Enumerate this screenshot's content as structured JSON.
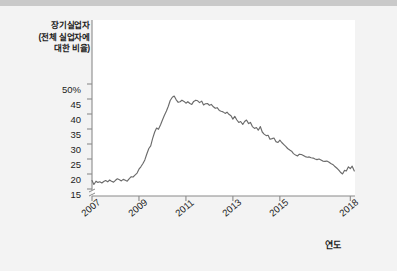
{
  "figure": {
    "background_color": "#f3f3f3",
    "plot_background_color": "#ffffff",
    "top_bar_color": "#c9c9c9",
    "line_color": "#6b6b6b",
    "axis_color": "#8a8a8a"
  },
  "chart_data": {
    "type": "line",
    "title": "",
    "subtitle": "",
    "ylabel": "장기실업자\n(전체 실업자에\n대한 비율)",
    "ylabel_lines": [
      "장기실업자",
      "(전체 실업자에",
      "대한 비율)"
    ],
    "xlabel": "연도",
    "ylim": [
      13,
      51
    ],
    "xlim": [
      2007.0,
      2018.2
    ],
    "grid": false,
    "legend": null,
    "axis_break_y": true,
    "ytick_labels": [
      "50%",
      "45",
      "40",
      "35",
      "30",
      "25",
      "20",
      "15"
    ],
    "ytick_values": [
      50,
      45,
      40,
      35,
      30,
      25,
      20,
      15
    ],
    "xtick_labels": [
      "2007",
      "2009",
      "2011",
      "2013",
      "2015",
      "2018"
    ],
    "xtick_values": [
      2007,
      2009,
      2011,
      2013,
      2015,
      2018
    ],
    "series": [
      {
        "name": "장기실업자 비율",
        "units": "percent",
        "x": [
          2007.0,
          2007.08,
          2007.17,
          2007.25,
          2007.33,
          2007.42,
          2007.5,
          2007.58,
          2007.67,
          2007.75,
          2007.83,
          2007.92,
          2008.0,
          2008.08,
          2008.17,
          2008.25,
          2008.33,
          2008.42,
          2008.5,
          2008.58,
          2008.67,
          2008.75,
          2008.83,
          2008.92,
          2009.0,
          2009.08,
          2009.17,
          2009.25,
          2009.33,
          2009.42,
          2009.5,
          2009.58,
          2009.67,
          2009.75,
          2009.83,
          2009.92,
          2010.0,
          2010.08,
          2010.17,
          2010.25,
          2010.33,
          2010.42,
          2010.5,
          2010.58,
          2010.67,
          2010.75,
          2010.83,
          2010.92,
          2011.0,
          2011.08,
          2011.17,
          2011.25,
          2011.33,
          2011.42,
          2011.5,
          2011.58,
          2011.67,
          2011.75,
          2011.83,
          2011.92,
          2012.0,
          2012.08,
          2012.17,
          2012.25,
          2012.33,
          2012.42,
          2012.5,
          2012.58,
          2012.67,
          2012.75,
          2012.83,
          2012.92,
          2013.0,
          2013.08,
          2013.17,
          2013.25,
          2013.33,
          2013.42,
          2013.5,
          2013.58,
          2013.67,
          2013.75,
          2013.83,
          2013.92,
          2014.0,
          2014.08,
          2014.17,
          2014.25,
          2014.33,
          2014.42,
          2014.5,
          2014.58,
          2014.67,
          2014.75,
          2014.83,
          2014.92,
          2015.0,
          2015.08,
          2015.17,
          2015.25,
          2015.33,
          2015.42,
          2015.5,
          2015.58,
          2015.67,
          2015.75,
          2015.83,
          2015.92,
          2016.0,
          2016.08,
          2016.17,
          2016.25,
          2016.33,
          2016.42,
          2016.5,
          2016.58,
          2016.67,
          2016.75,
          2016.83,
          2016.92,
          2017.0,
          2017.08,
          2017.17,
          2017.25,
          2017.33,
          2017.42,
          2017.5,
          2017.58,
          2017.67,
          2017.75,
          2017.83,
          2017.92,
          2018.0,
          2018.08,
          2018.17
        ],
        "values": [
          17.8,
          16.5,
          17.6,
          17.2,
          17.4,
          17.0,
          17.5,
          17.8,
          17.4,
          18.0,
          17.6,
          17.3,
          17.9,
          18.4,
          18.1,
          17.7,
          18.2,
          17.9,
          17.6,
          18.4,
          19.1,
          19.0,
          19.6,
          20.3,
          21.6,
          22.4,
          23.5,
          24.7,
          26.6,
          28.5,
          29.4,
          31.8,
          34.0,
          35.3,
          34.9,
          36.4,
          38.0,
          39.5,
          41.0,
          42.6,
          44.5,
          45.6,
          46.0,
          44.8,
          43.9,
          44.1,
          44.6,
          44.2,
          43.6,
          44.1,
          43.5,
          43.2,
          44.2,
          44.6,
          44.4,
          43.8,
          44.3,
          43.0,
          43.4,
          43.5,
          42.9,
          43.2,
          42.4,
          41.9,
          42.1,
          41.2,
          40.9,
          40.7,
          40.2,
          40.6,
          39.9,
          39.4,
          38.3,
          39.2,
          38.0,
          37.2,
          37.5,
          36.5,
          37.5,
          38.0,
          36.8,
          37.2,
          35.8,
          35.2,
          35.5,
          34.6,
          35.8,
          34.0,
          33.3,
          32.8,
          32.9,
          31.6,
          31.8,
          32.0,
          30.8,
          30.5,
          31.3,
          30.5,
          29.8,
          29.2,
          28.5,
          28.0,
          27.6,
          26.8,
          26.3,
          26.0,
          26.6,
          26.5,
          26.2,
          25.8,
          25.6,
          25.7,
          25.4,
          25.3,
          25.0,
          24.8,
          25.0,
          24.7,
          24.3,
          24.2,
          24.3,
          24.0,
          23.5,
          23.2,
          22.6,
          22.0,
          21.4,
          20.6,
          20.0,
          21.2,
          21.0,
          22.4,
          21.8,
          22.6,
          21.0
        ]
      }
    ]
  }
}
